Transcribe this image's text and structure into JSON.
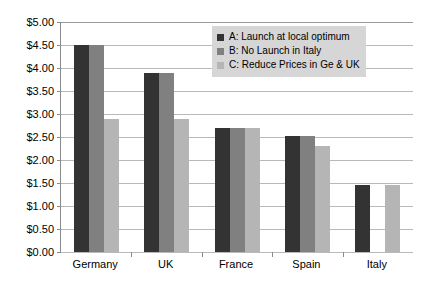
{
  "chart_data": {
    "type": "bar",
    "title": "",
    "xlabel": "",
    "ylabel": "",
    "ylim": [
      0,
      5
    ],
    "ytick_step": 0.5,
    "ytick_labels": [
      "$5.00",
      "$4.50",
      "$4.00",
      "$3.50",
      "$3.00",
      "$2.50",
      "$2.00",
      "$1.50",
      "$1.00",
      "$0.50",
      "$0.00"
    ],
    "ytick_values": [
      5.0,
      4.5,
      4.0,
      3.5,
      3.0,
      2.5,
      2.0,
      1.5,
      1.0,
      0.5,
      0.0
    ],
    "grid": true,
    "legend_position": "top-center-right",
    "categories": [
      "Germany",
      "UK",
      "France",
      "Spain",
      "Italy"
    ],
    "series": [
      {
        "name": "A: Launch at local optimum",
        "key": "A",
        "color": "#333333",
        "values": [
          4.5,
          3.9,
          2.7,
          2.52,
          1.45
        ]
      },
      {
        "name": "B: No Launch in Italy",
        "key": "B",
        "color": "#808080",
        "values": [
          4.5,
          3.9,
          2.7,
          2.52,
          0.0
        ]
      },
      {
        "name": "C: Reduce Prices in Ge & UK",
        "key": "C",
        "color": "#b5b5b5",
        "values": [
          2.89,
          2.89,
          2.7,
          2.3,
          1.45
        ]
      }
    ]
  },
  "legend": {
    "items": [
      {
        "label": "A: Launch at local optimum"
      },
      {
        "label": "B: No Launch in Italy"
      },
      {
        "label": "C: Reduce Prices in Ge & UK"
      }
    ]
  },
  "colors": {
    "series_a": "#333333",
    "series_b": "#808080",
    "series_c": "#b5b5b5",
    "gridline": "#b9b9b9",
    "axis": "#8a8a8a",
    "legend_background": "#d6d6d6",
    "background": "#ffffff"
  }
}
